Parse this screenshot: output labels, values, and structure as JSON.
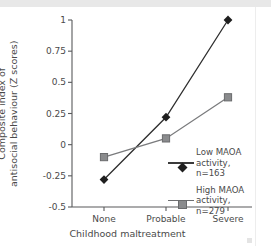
{
  "chart_data": {
    "type": "line",
    "title": "",
    "xlabel": "Childhood maltreatment",
    "ylabel_line1": "Composite index of",
    "ylabel_line2": "antisocial behaviour (Z scores)",
    "categories": [
      "None",
      "Probable",
      "Severe"
    ],
    "ylim": [
      -0.5,
      1
    ],
    "ytick_labels": [
      "1",
      "0.75",
      "0.5",
      "0.25",
      "0",
      "-0.25",
      "-0.5"
    ],
    "ytick_values": [
      1,
      0.75,
      0.5,
      0.25,
      0,
      -0.25,
      -0.5
    ],
    "grid": false,
    "legend_position": "center-right",
    "series": [
      {
        "name": "Low MAOA activity",
        "legend_label_line1": "Low MAOA",
        "legend_label_line2": "activity, n=163",
        "n": 163,
        "marker": "diamond",
        "color": "#2e2e2e",
        "values": [
          -0.28,
          0.22,
          1.0
        ]
      },
      {
        "name": "High MAOA activity",
        "legend_label_line1": "High MAOA",
        "legend_label_line2": "activity, n=279",
        "n": 279,
        "marker": "square",
        "color": "#7a7b7d",
        "values": [
          -0.1,
          0.05,
          0.38
        ]
      }
    ]
  }
}
